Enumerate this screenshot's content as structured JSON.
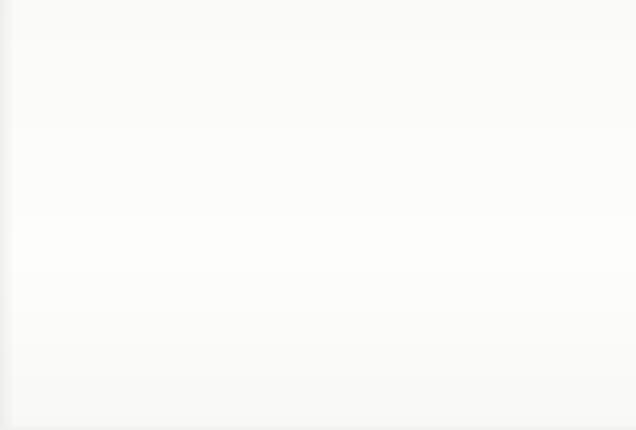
{
  "chart_data": {
    "type": "bar",
    "title": "",
    "subtitle": "",
    "xlabel": "",
    "ylabel": "",
    "grid": true,
    "legend": null,
    "legend_position": "none",
    "bar_color": "#1b1b1b",
    "gridline_color": "#8c8c8c",
    "background_color": "#fdfdfc",
    "xlim": [
      1929,
      2000.5
    ],
    "ylim": [
      0,
      6.4
    ],
    "y_gridline_count": 6,
    "y_gridline_values": [
      1,
      2,
      3,
      4,
      5,
      6
    ],
    "y_tick_labels": [],
    "x_tick_labels": [
      "1930",
      "1935",
      "1940",
      "1945",
      "1950",
      "1955",
      "1960",
      "1965",
      "1970",
      "1975",
      "1980",
      "1985",
      "1990",
      "1995",
      "2000"
    ],
    "x_tick_values": [
      1930,
      1935,
      1940,
      1945,
      1950,
      1955,
      1960,
      1965,
      1970,
      1975,
      1980,
      1985,
      1990,
      1995,
      2000
    ],
    "x_tick_label_rotation": 90,
    "categories": [
      1932,
      1933,
      1934,
      1936,
      1937,
      1939,
      1940,
      1941,
      1944,
      1945,
      1948,
      1951,
      1952,
      1953,
      1955,
      1960,
      1964,
      1965,
      1966,
      1969,
      1971,
      1973,
      1974,
      1975,
      1976,
      1979,
      1980,
      1983,
      1984,
      1986,
      1988,
      1989,
      1990,
      1991,
      1992,
      1994,
      1995,
      1996,
      1997,
      1998
    ],
    "values": [
      0.6,
      0.6,
      0.6,
      0.6,
      0.6,
      0.6,
      0.6,
      0.6,
      1.15,
      0.6,
      0.6,
      0.6,
      0.6,
      1.15,
      0.6,
      0.6,
      1.15,
      0.6,
      0.6,
      0.6,
      0.6,
      0.6,
      1.15,
      0.6,
      1.15,
      0.6,
      0.6,
      0.6,
      0.6,
      1.5,
      0.6,
      2.55,
      1.5,
      1.95,
      0.6,
      1.5,
      2.9,
      1.2,
      5.7,
      4.1
    ],
    "series": [
      {
        "name": "count",
        "points": [
          {
            "x": 1932,
            "y": 0.6
          },
          {
            "x": 1933,
            "y": 0.6
          },
          {
            "x": 1934,
            "y": 0.6
          },
          {
            "x": 1936,
            "y": 0.6
          },
          {
            "x": 1937,
            "y": 0.6
          },
          {
            "x": 1939,
            "y": 0.6
          },
          {
            "x": 1940,
            "y": 0.6
          },
          {
            "x": 1941,
            "y": 0.6
          },
          {
            "x": 1944,
            "y": 1.15
          },
          {
            "x": 1945,
            "y": 0.6
          },
          {
            "x": 1948,
            "y": 0.6
          },
          {
            "x": 1951,
            "y": 0.6
          },
          {
            "x": 1952,
            "y": 0.6
          },
          {
            "x": 1953,
            "y": 1.15
          },
          {
            "x": 1955,
            "y": 0.6
          },
          {
            "x": 1960,
            "y": 0.6
          },
          {
            "x": 1964,
            "y": 1.15
          },
          {
            "x": 1965,
            "y": 0.6
          },
          {
            "x": 1966,
            "y": 0.6
          },
          {
            "x": 1969,
            "y": 0.6
          },
          {
            "x": 1971,
            "y": 0.6
          },
          {
            "x": 1973,
            "y": 0.6
          },
          {
            "x": 1974,
            "y": 1.15
          },
          {
            "x": 1975,
            "y": 0.6
          },
          {
            "x": 1976,
            "y": 1.15
          },
          {
            "x": 1979,
            "y": 0.6
          },
          {
            "x": 1980,
            "y": 0.6
          },
          {
            "x": 1983,
            "y": 0.6
          },
          {
            "x": 1984,
            "y": 0.6
          },
          {
            "x": 1986,
            "y": 1.5
          },
          {
            "x": 1988,
            "y": 0.6
          },
          {
            "x": 1989,
            "y": 2.55
          },
          {
            "x": 1990,
            "y": 1.5
          },
          {
            "x": 1991,
            "y": 1.95
          },
          {
            "x": 1992,
            "y": 0.6
          },
          {
            "x": 1994,
            "y": 1.5
          },
          {
            "x": 1995,
            "y": 2.9
          },
          {
            "x": 1996,
            "y": 1.2
          },
          {
            "x": 1997,
            "y": 5.7
          },
          {
            "x": 1998,
            "y": 4.1
          }
        ]
      }
    ]
  },
  "geometry": {
    "baseline_y": 368,
    "baseline_tilt_px": 9,
    "gridlines_y": [
      26,
      80,
      135,
      189,
      243,
      297
    ],
    "gridline_tilt_px": 9,
    "plot_left": 10,
    "plot_right": 630,
    "x_origin_px": 13,
    "px_per_year": 8.68,
    "bar_width_px": 6,
    "unit_height_px": 54
  }
}
